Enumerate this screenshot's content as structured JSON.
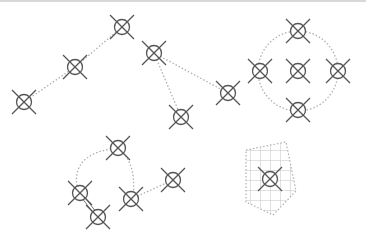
{
  "colors": {
    "node_stroke": "#555555",
    "edge": "#b0b0b0",
    "grid": "#c4c4c4",
    "background": "#ffffff"
  },
  "icon": "crossed-circle-node-icon",
  "nodes": [
    {
      "id": "n1",
      "x": 24,
      "y": 102,
      "group": "chain"
    },
    {
      "id": "n2",
      "x": 75,
      "y": 67,
      "group": "chain"
    },
    {
      "id": "n3",
      "x": 122,
      "y": 27,
      "group": "chain"
    },
    {
      "id": "n4",
      "x": 154,
      "y": 53,
      "group": "chain"
    },
    {
      "id": "n5",
      "x": 181,
      "y": 117,
      "group": "chain"
    },
    {
      "id": "n6",
      "x": 228,
      "y": 93,
      "group": "chain"
    },
    {
      "id": "r1",
      "x": 298,
      "y": 31,
      "group": "ring"
    },
    {
      "id": "r2",
      "x": 260,
      "y": 71,
      "group": "ring"
    },
    {
      "id": "r3",
      "x": 298,
      "y": 71,
      "group": "ring"
    },
    {
      "id": "r4",
      "x": 338,
      "y": 71,
      "group": "ring"
    },
    {
      "id": "r5",
      "x": 298,
      "y": 110,
      "group": "ring"
    },
    {
      "id": "l1",
      "x": 118,
      "y": 148,
      "group": "loop"
    },
    {
      "id": "l2",
      "x": 80,
      "y": 193,
      "group": "loop"
    },
    {
      "id": "l3",
      "x": 98,
      "y": 217,
      "group": "loop"
    },
    {
      "id": "l4",
      "x": 131,
      "y": 199,
      "group": "loop"
    },
    {
      "id": "l5",
      "x": 173,
      "y": 180,
      "group": "loop"
    },
    {
      "id": "p1",
      "x": 270,
      "y": 179,
      "group": "grid-area"
    }
  ],
  "edges": [
    {
      "from": "n1",
      "to": "n2",
      "style": "dotted"
    },
    {
      "from": "n2",
      "to": "n3",
      "style": "dotted"
    },
    {
      "from": "n4",
      "to": "n5",
      "style": "dotted"
    },
    {
      "from": "n4",
      "to": "n6",
      "style": "dotted"
    },
    {
      "from": "l4",
      "to": "l5",
      "style": "dotted"
    },
    {
      "from": "l2",
      "to": "l3",
      "style": "solid-double"
    }
  ],
  "ring": {
    "cx": 298,
    "cy": 71,
    "r": 40
  },
  "loop_path": "M118,148 C95,150 70,160 78,190 M118,148 C128,155 136,170 133,196",
  "polygon": {
    "points": "246,150 286,142 296,191 273,215 246,202"
  }
}
